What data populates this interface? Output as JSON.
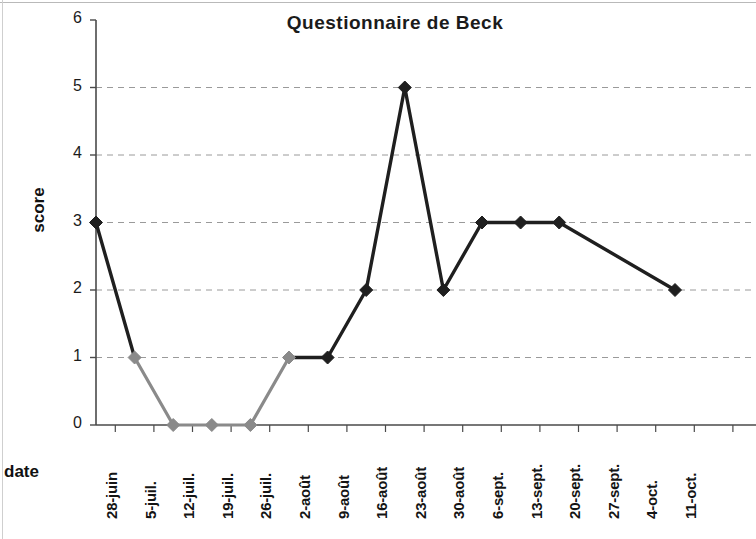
{
  "chart_data": {
    "type": "line",
    "title": "Questionnaire de Beck",
    "xlabel": "date",
    "ylabel": "score",
    "ylim": [
      0,
      6
    ],
    "yticks": [
      0,
      1,
      2,
      3,
      4,
      5,
      6
    ],
    "grid": true,
    "legend": null,
    "categories": [
      "28-juin",
      "5-juil.",
      "12-juil.",
      "19-juil.",
      "26-juil.",
      "2-août",
      "9-août",
      "16-août",
      "23-août",
      "30-août",
      "6-sept.",
      "13-sept.",
      "20-sept.",
      "27-sept.",
      "4-oct.",
      "11-oct."
    ],
    "values": [
      3,
      1,
      0,
      0,
      0,
      1,
      1,
      2,
      5,
      2,
      3,
      3,
      3,
      null,
      null,
      2
    ],
    "series": [
      {
        "name": "score",
        "values": [
          3,
          1,
          0,
          0,
          0,
          1,
          1,
          2,
          5,
          2,
          3,
          3,
          3,
          null,
          null,
          2
        ],
        "marker": "diamond"
      }
    ],
    "points": [
      {
        "x": "28-juin",
        "y": 3,
        "color": "#1f1f1f"
      },
      {
        "x": "5-juil.",
        "y": 1,
        "color": "#8a8a8a"
      },
      {
        "x": "12-juil.",
        "y": 0,
        "color": "#8a8a8a"
      },
      {
        "x": "19-juil.",
        "y": 0,
        "color": "#8a8a8a"
      },
      {
        "x": "26-juil.",
        "y": 0,
        "color": "#8a8a8a"
      },
      {
        "x": "2-août",
        "y": 1,
        "color": "#8a8a8a"
      },
      {
        "x": "9-août",
        "y": 1,
        "color": "#1f1f1f"
      },
      {
        "x": "16-août",
        "y": 2,
        "color": "#1f1f1f"
      },
      {
        "x": "23-août",
        "y": 5,
        "color": "#1f1f1f"
      },
      {
        "x": "30-août",
        "y": 2,
        "color": "#1f1f1f"
      },
      {
        "x": "6-sept.",
        "y": 3,
        "color": "#1f1f1f"
      },
      {
        "x": "13-sept.",
        "y": 3,
        "color": "#1f1f1f"
      },
      {
        "x": "20-sept.",
        "y": 3,
        "color": "#1f1f1f"
      },
      {
        "x": "11-oct.",
        "y": 2,
        "color": "#1f1f1f"
      }
    ],
    "colors": {
      "line_dark": "#1f1f1f",
      "line_light": "#8a8a8a",
      "grid": "#9a9a9a",
      "axis": "#4a4a4a",
      "background": "#ffffff",
      "text": "#141414"
    }
  },
  "geometry": {
    "x0": 96,
    "dx": 38.6,
    "y0": 425,
    "dy": 67.5
  }
}
